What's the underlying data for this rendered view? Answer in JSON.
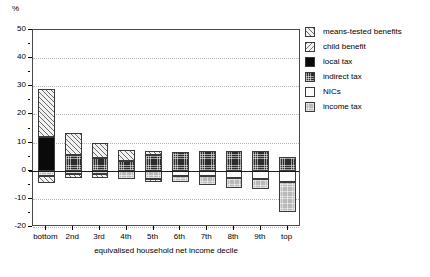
{
  "chart_data": {
    "type": "bar",
    "subtype": "stacked-diverging",
    "title": "",
    "xlabel": "equivalised household net income decile",
    "ylabel": "%",
    "ylim": [
      -20,
      50
    ],
    "yticks": [
      50,
      40,
      30,
      20,
      10,
      0,
      -10,
      -20
    ],
    "ytick_labels": [
      "50",
      "40",
      "30",
      "20",
      "10",
      "0",
      "-10",
      "-20"
    ],
    "yminor_step": 5,
    "grid": "horizontal-dotted",
    "legend_position": "right",
    "categories": [
      "bottom",
      "2nd",
      "3rd",
      "4th",
      "5th",
      "6th",
      "7th",
      "8th",
      "9th",
      "top"
    ],
    "series": [
      {
        "name": "means-tested benefits",
        "fill": "diagonal-hatch-forward",
        "color": "#f2f2f2",
        "values": [
          17.0,
          8.0,
          5.5,
          4.0,
          1.5,
          0.0,
          0.0,
          0.0,
          0.0,
          0.0
        ]
      },
      {
        "name": "child benefit",
        "fill": "diagonal-hatch-backward",
        "color": "#f2f2f2",
        "values": [
          0.0,
          0.0,
          0.0,
          0.0,
          0.0,
          0.0,
          0.0,
          0.0,
          0.0,
          0.0
        ]
      },
      {
        "name": "local tax",
        "fill": "solid-black",
        "color": "#0a0a0a",
        "values": [
          12.0,
          0.0,
          0.0,
          0.0,
          0.0,
          0.0,
          0.0,
          0.0,
          0.0,
          0.0
        ]
      },
      {
        "name": "indirect tax",
        "fill": "dark-checker",
        "color": "#2b2b2b",
        "values": [
          0.0,
          5.5,
          4.5,
          3.5,
          5.5,
          6.5,
          7.0,
          7.0,
          7.0,
          5.0
        ]
      },
      {
        "name": "NICs",
        "fill": "white",
        "color": "#fbfbfb",
        "values": [
          0.0,
          0.0,
          0.0,
          0.0,
          0.0,
          -2.0,
          -2.5,
          -3.0,
          -3.5,
          -4.0
        ]
      },
      {
        "name": "income tax",
        "fill": "light-checker",
        "color": "#b9b9b9",
        "values": [
          -2.0,
          -1.5,
          -2.0,
          -2.5,
          -3.5,
          -2.0,
          -3.0,
          -3.0,
          -3.0,
          -10.5
        ]
      }
    ],
    "bars": [
      {
        "category": "bottom",
        "positive_total": 29.0,
        "negative_total": -4.5,
        "positive_stack": [
          {
            "series": "local tax",
            "from": 0.0,
            "to": 12.0
          },
          {
            "series": "means-tested benefits",
            "from": 12.0,
            "to": 29.0
          }
        ],
        "negative_stack": [
          {
            "series": "income tax",
            "from": 0.0,
            "to": -2.0
          },
          {
            "series": "means-tested benefits",
            "from": -2.0,
            "to": -4.5
          }
        ]
      },
      {
        "category": "2nd",
        "positive_total": 13.5,
        "negative_total": -2.5,
        "positive_stack": [
          {
            "series": "indirect tax",
            "from": 0.0,
            "to": 5.5
          },
          {
            "series": "means-tested benefits",
            "from": 5.5,
            "to": 13.5
          }
        ],
        "negative_stack": [
          {
            "series": "income tax",
            "from": 0.0,
            "to": -1.0
          },
          {
            "series": "means-tested benefits",
            "from": -1.0,
            "to": -2.5
          }
        ]
      },
      {
        "category": "3rd",
        "positive_total": 10.0,
        "negative_total": -2.5,
        "positive_stack": [
          {
            "series": "indirect tax",
            "from": 0.0,
            "to": 4.5
          },
          {
            "series": "means-tested benefits",
            "from": 4.5,
            "to": 10.0
          }
        ],
        "negative_stack": [
          {
            "series": "income tax",
            "from": 0.0,
            "to": -1.0
          },
          {
            "series": "means-tested benefits",
            "from": -1.0,
            "to": -2.5
          }
        ]
      },
      {
        "category": "4th",
        "positive_total": 7.5,
        "negative_total": -3.0,
        "positive_stack": [
          {
            "series": "indirect tax",
            "from": 0.0,
            "to": 3.5
          },
          {
            "series": "means-tested benefits",
            "from": 3.5,
            "to": 7.5
          }
        ],
        "negative_stack": [
          {
            "series": "income tax",
            "from": 0.0,
            "to": -3.0
          }
        ]
      },
      {
        "category": "5th",
        "positive_total": 7.0,
        "negative_total": -4.0,
        "positive_stack": [
          {
            "series": "indirect tax",
            "from": 0.0,
            "to": 5.5
          },
          {
            "series": "means-tested benefits",
            "from": 5.5,
            "to": 7.0
          }
        ],
        "negative_stack": [
          {
            "series": "income tax",
            "from": 0.0,
            "to": -3.0
          },
          {
            "series": "means-tested benefits",
            "from": -3.0,
            "to": -4.0
          }
        ]
      },
      {
        "category": "6th",
        "positive_total": 6.5,
        "negative_total": -4.0,
        "positive_stack": [
          {
            "series": "indirect tax",
            "from": 0.0,
            "to": 6.5
          }
        ],
        "negative_stack": [
          {
            "series": "NICs",
            "from": 0.0,
            "to": -2.0
          },
          {
            "series": "income tax",
            "from": -2.0,
            "to": -4.0
          }
        ]
      },
      {
        "category": "7th",
        "positive_total": 7.0,
        "negative_total": -5.0,
        "positive_stack": [
          {
            "series": "indirect tax",
            "from": 0.0,
            "to": 7.0
          }
        ],
        "negative_stack": [
          {
            "series": "NICs",
            "from": 0.0,
            "to": -2.0
          },
          {
            "series": "income tax",
            "from": -2.0,
            "to": -5.0
          }
        ]
      },
      {
        "category": "8th",
        "positive_total": 7.0,
        "negative_total": -6.0,
        "positive_stack": [
          {
            "series": "indirect tax",
            "from": 0.0,
            "to": 7.0
          }
        ],
        "negative_stack": [
          {
            "series": "NICs",
            "from": 0.0,
            "to": -2.5
          },
          {
            "series": "income tax",
            "from": -2.5,
            "to": -6.0
          }
        ]
      },
      {
        "category": "9th",
        "positive_total": 7.0,
        "negative_total": -6.5,
        "positive_stack": [
          {
            "series": "indirect tax",
            "from": 0.0,
            "to": 7.0
          }
        ],
        "negative_stack": [
          {
            "series": "NICs",
            "from": 0.0,
            "to": -3.0
          },
          {
            "series": "income tax",
            "from": -3.0,
            "to": -6.5
          }
        ]
      },
      {
        "category": "top",
        "positive_total": 5.0,
        "negative_total": -14.5,
        "positive_stack": [
          {
            "series": "indirect tax",
            "from": 0.0,
            "to": 5.0
          }
        ],
        "negative_stack": [
          {
            "series": "NICs",
            "from": 0.0,
            "to": -4.0
          },
          {
            "series": "income tax",
            "from": -4.0,
            "to": -14.5
          }
        ]
      }
    ]
  },
  "legend": {
    "items": [
      {
        "label": "means-tested benefits",
        "swatch": "means-tested-benefits-swatch",
        "fill_class": "f-means"
      },
      {
        "label": "child benefit",
        "swatch": "child-benefit-swatch",
        "fill_class": "f-child"
      },
      {
        "label": "local tax",
        "swatch": "local-tax-swatch",
        "fill_class": "f-local"
      },
      {
        "label": "indirect tax",
        "swatch": "indirect-tax-swatch",
        "fill_class": "f-indirect"
      },
      {
        "label": "NICs",
        "swatch": "nics-swatch",
        "fill_class": "f-nics"
      },
      {
        "label": "income tax",
        "swatch": "income-tax-swatch",
        "fill_class": "f-income"
      }
    ]
  }
}
